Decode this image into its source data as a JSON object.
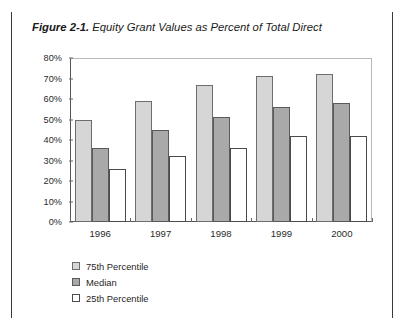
{
  "figure": {
    "number": "Figure 2-1.",
    "caption": "Equity Grant Values as Percent of Total Direct"
  },
  "source_note": "",
  "legend": {
    "position": "below-left",
    "items": [
      {
        "label": "75th Percentile",
        "color": "#d6d6d6"
      },
      {
        "label": "Median",
        "color": "#a9a9a9"
      },
      {
        "label": "25th Percentile",
        "color": "#ffffff"
      }
    ]
  },
  "axis": {
    "yticks": [
      "0%",
      "10%",
      "20%",
      "30%",
      "40%",
      "50%",
      "60%",
      "70%",
      "80%"
    ],
    "ytick_values": [
      0,
      10,
      20,
      30,
      40,
      50,
      60,
      70,
      80
    ]
  },
  "chart_data": {
    "type": "bar",
    "title": "Equity Grant Values as Percent of Total Direct",
    "xlabel": "",
    "ylabel": "",
    "ylim": [
      0,
      80
    ],
    "grid": false,
    "legend_position": "bottom-left",
    "categories": [
      "1996",
      "1997",
      "1998",
      "1999",
      "2000"
    ],
    "series": [
      {
        "name": "75th Percentile",
        "color": "#d6d6d6",
        "values": [
          50,
          59,
          67,
          71,
          72
        ]
      },
      {
        "name": "Median",
        "color": "#a9a9a9",
        "values": [
          36,
          45,
          51,
          56,
          58
        ]
      },
      {
        "name": "25th Percentile",
        "color": "#ffffff",
        "values": [
          26,
          32,
          36,
          42,
          42
        ]
      }
    ]
  }
}
